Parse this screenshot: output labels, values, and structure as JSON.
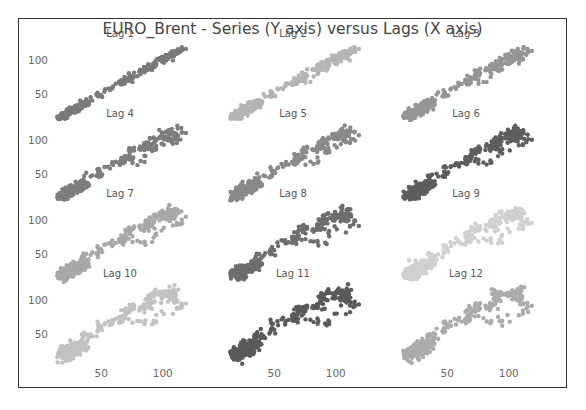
{
  "chart_data": {
    "type": "scatter",
    "title": "EURO_Brent - Series (Y axis) versus Lags (X axis)",
    "xlabel": "Lag value",
    "ylabel": "Series value",
    "grid": false,
    "layout": {
      "rows": 4,
      "cols": 3
    },
    "x_ticks": [
      50,
      100
    ],
    "y_ticks": [
      50,
      100
    ],
    "xlim": [
      10,
      140
    ],
    "ylim": [
      10,
      140
    ],
    "panels": [
      {
        "label": "Lag 1",
        "color": "#7a7a7a",
        "spread": 0.05
      },
      {
        "label": "Lag 2",
        "color": "#b5b5b5",
        "spread": 0.1
      },
      {
        "label": "Lag 3",
        "color": "#959595",
        "spread": 0.14
      },
      {
        "label": "Lag 4",
        "color": "#7e7e7e",
        "spread": 0.18
      },
      {
        "label": "Lag 5",
        "color": "#8a8a8a",
        "spread": 0.21
      },
      {
        "label": "Lag 6",
        "color": "#5e5e5e",
        "spread": 0.24
      },
      {
        "label": "Lag 7",
        "color": "#a8a8a8",
        "spread": 0.27
      },
      {
        "label": "Lag 8",
        "color": "#6e6e6e",
        "spread": 0.3
      },
      {
        "label": "Lag 9",
        "color": "#d0d0d0",
        "spread": 0.32
      },
      {
        "label": "Lag 10",
        "color": "#c2c2c2",
        "spread": 0.34
      },
      {
        "label": "Lag 11",
        "color": "#5a5a5a",
        "spread": 0.36
      },
      {
        "label": "Lag 12",
        "color": "#ababab",
        "spread": 0.38
      }
    ]
  }
}
